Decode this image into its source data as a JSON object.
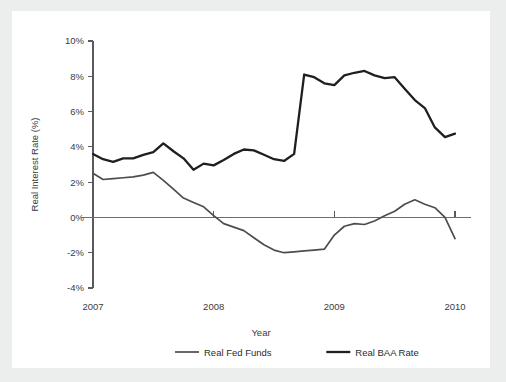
{
  "chart_data": {
    "type": "line",
    "title": "",
    "xlabel": "Year",
    "ylabel": "Real Interest Rate (%)",
    "xlim": [
      2007.0,
      2010.0
    ],
    "ylim": [
      -4,
      10
    ],
    "grid": false,
    "legend_position": "bottom",
    "x_tick_labels": [
      "2007",
      "2008",
      "2009",
      "2010"
    ],
    "x_tick_values": [
      2007,
      2008,
      2009,
      2010
    ],
    "y_tick_labels": [
      "10%",
      "8%",
      "6%",
      "4%",
      "2%",
      "0%",
      "-2%",
      "-4%"
    ],
    "y_tick_values": [
      10,
      8,
      6,
      4,
      2,
      0,
      -2,
      -4
    ],
    "series": [
      {
        "name": "Real Fed Funds",
        "color": "#4d4d4d",
        "width": 1.7,
        "x": [
          2007.0,
          2007.083,
          2007.167,
          2007.25,
          2007.333,
          2007.417,
          2007.5,
          2007.583,
          2007.667,
          2007.75,
          2007.833,
          2007.917,
          2008.0,
          2008.083,
          2008.167,
          2008.25,
          2008.333,
          2008.417,
          2008.5,
          2008.583,
          2008.667,
          2008.75,
          2008.833,
          2008.917,
          2009.0,
          2009.083,
          2009.167,
          2009.25,
          2009.333,
          2009.417,
          2009.5,
          2009.583,
          2009.667,
          2009.75,
          2009.833,
          2009.917,
          2010.0
        ],
        "values": [
          2.5,
          2.15,
          2.2,
          2.25,
          2.3,
          2.4,
          2.55,
          2.1,
          1.6,
          1.1,
          0.85,
          0.6,
          0.1,
          -0.35,
          -0.55,
          -0.75,
          -1.15,
          -1.55,
          -1.85,
          -2.0,
          -1.95,
          -1.9,
          -1.85,
          -1.8,
          -1.0,
          -0.5,
          -0.35,
          -0.4,
          -0.2,
          0.1,
          0.35,
          0.75,
          1.0,
          0.75,
          0.55,
          0.0,
          -1.2
        ]
      },
      {
        "name": "Real BAA Rate",
        "color": "#1f1f1f",
        "width": 2.3,
        "x": [
          2007.0,
          2007.083,
          2007.167,
          2007.25,
          2007.333,
          2007.417,
          2007.5,
          2007.583,
          2007.667,
          2007.75,
          2007.833,
          2007.917,
          2008.0,
          2008.083,
          2008.167,
          2008.25,
          2008.333,
          2008.417,
          2008.5,
          2008.583,
          2008.667,
          2008.75,
          2008.833,
          2008.917,
          2009.0,
          2009.083,
          2009.167,
          2009.25,
          2009.333,
          2009.417,
          2009.5,
          2009.583,
          2009.667,
          2009.75,
          2009.833,
          2009.917,
          2010.0
        ],
        "values": [
          3.6,
          3.3,
          3.15,
          3.35,
          3.35,
          3.55,
          3.7,
          4.2,
          3.75,
          3.35,
          2.7,
          3.05,
          2.95,
          3.25,
          3.6,
          3.85,
          3.8,
          3.55,
          3.3,
          3.2,
          3.6,
          8.1,
          7.95,
          7.6,
          7.5,
          8.05,
          8.2,
          8.3,
          8.05,
          7.9,
          7.95,
          7.3,
          6.65,
          6.2,
          5.1,
          4.55,
          4.75
        ]
      }
    ]
  },
  "legend": {
    "items": [
      {
        "label": "Real Fed Funds"
      },
      {
        "label": "Real BAA Rate"
      }
    ]
  }
}
